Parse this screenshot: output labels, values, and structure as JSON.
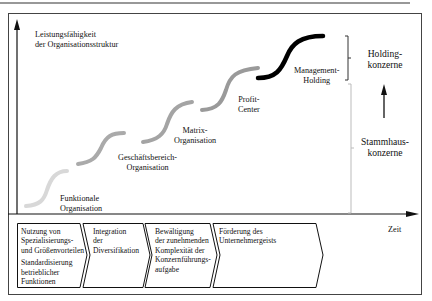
{
  "diagram": {
    "y_axis_label": [
      "Leistungsfähigkeit",
      "der Organisationsstruktur"
    ],
    "x_axis_label": "Zeit",
    "stages": [
      {
        "label": [
          "Funktionale",
          "Organisation"
        ],
        "color": "#d6d6d6"
      },
      {
        "label": [
          "Geschäftsbereich-",
          "Organisation"
        ],
        "color": "#a9a9a9"
      },
      {
        "label": [
          "Matrix-",
          "Organisation"
        ],
        "color": "#a2a2a2"
      },
      {
        "label": [
          "Profit-",
          "Center"
        ],
        "color": "#9a9a9a"
      },
      {
        "label": [
          "Management-",
          "Holding"
        ],
        "color": "#000000"
      }
    ],
    "groups": {
      "holding": [
        "Holding-",
        "konzerne"
      ],
      "stammhaus": [
        "Stammhaus-",
        "konzerne"
      ]
    },
    "steps": [
      {
        "lines": [
          "Nutzung von",
          "Spezialisierungs-",
          "und Größenvorteilen"
        ],
        "lines2": [
          "Standardisierung",
          "betrieblicher",
          "Funktionen"
        ]
      },
      {
        "lines": [
          "Integration",
          "der",
          "Diversifikation"
        ]
      },
      {
        "lines": [
          "Bewältigung",
          "der zunehmenden",
          "Komplexität der",
          "Konzernführungs-",
          "aufgabe"
        ]
      },
      {
        "lines": [
          "Förderung des",
          "Unternehmergeists"
        ]
      }
    ]
  }
}
